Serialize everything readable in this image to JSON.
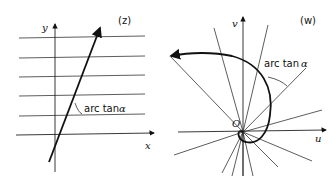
{
  "figure": {
    "left_panel": {
      "plane_label": "(z)",
      "x_axis_label": "x",
      "y_axis_label": "y",
      "angle_label_text": "arc tan",
      "angle_label_symbol": "α",
      "horizontal_lines": 6
    },
    "right_panel": {
      "plane_label": "(w)",
      "u_axis_label": "u",
      "v_axis_label": "v",
      "origin_label": "O",
      "angle_label_text": "arc tan",
      "angle_label_symbol": "α",
      "radial_lines": 12
    }
  }
}
